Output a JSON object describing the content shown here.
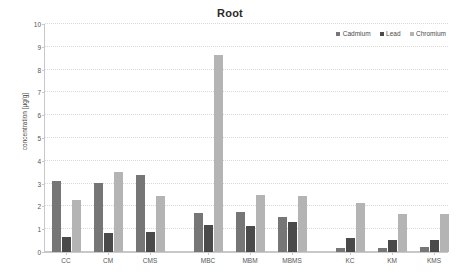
{
  "chart_data": {
    "type": "bar",
    "title": "Root",
    "xlabel": "",
    "ylabel": "concentration [µg/g]",
    "ylim": [
      0,
      10
    ],
    "yticks": [
      0,
      1,
      2,
      3,
      4,
      5,
      6,
      7,
      8,
      9,
      10
    ],
    "grid": true,
    "legend_position": "top-right",
    "categories": [
      "CC",
      "CM",
      "CMS",
      "MBC",
      "MBM",
      "MBMS",
      "KC",
      "KM",
      "KMS"
    ],
    "category_groups": [
      [
        "CC",
        "CM",
        "CMS"
      ],
      [
        "MBC",
        "MBM",
        "MBMS"
      ],
      [
        "KC",
        "KM",
        "KMS"
      ]
    ],
    "series": [
      {
        "name": "Cadmium",
        "color": "#767676",
        "values": [
          3.1,
          3.03,
          3.38,
          1.7,
          1.77,
          1.53,
          0.18,
          0.17,
          0.2
        ]
      },
      {
        "name": "Lead",
        "color": "#4a4a4a",
        "values": [
          0.65,
          0.85,
          0.88,
          1.2,
          1.13,
          1.3,
          0.63,
          0.51,
          0.53
        ]
      },
      {
        "name": "Chromium",
        "color": "#b4b4b4",
        "values": [
          2.28,
          3.52,
          2.45,
          8.62,
          2.52,
          2.44,
          2.14,
          1.65,
          1.65
        ]
      }
    ]
  }
}
